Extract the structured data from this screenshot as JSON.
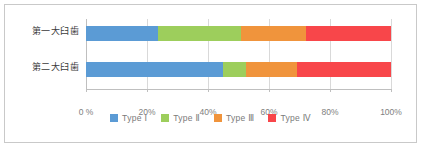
{
  "chart_data": {
    "type": "bar",
    "orientation": "horizontal",
    "stacked": true,
    "normalized_percent": true,
    "title": "",
    "xlabel": "",
    "ylabel": "",
    "categories": [
      "第一大臼歯",
      "第二大臼歯"
    ],
    "series": [
      {
        "name": "Type Ⅰ",
        "color": "#5b9bd5",
        "values": [
          23.6,
          45.0
        ]
      },
      {
        "name": "Type Ⅱ",
        "color": "#9dce5c",
        "values": [
          27.2,
          7.5
        ]
      },
      {
        "name": "Type Ⅲ",
        "color": "#f0943c",
        "values": [
          21.3,
          16.7
        ]
      },
      {
        "name": "Type Ⅳ",
        "color": "#f8464a",
        "values": [
          27.9,
          30.8
        ]
      }
    ],
    "xlim": [
      0,
      100
    ],
    "xticks": [
      0,
      20,
      40,
      60,
      80,
      100
    ],
    "xtick_labels": [
      "0 %",
      "20%",
      "40%",
      "60%",
      "80%",
      "100%"
    ],
    "grid": true,
    "legend_position": "bottom"
  },
  "colors": {
    "frame_border": "#c9c9c9",
    "gridline": "#d9d9d9",
    "axis": "#bfbfbf",
    "tick_label": "#808080",
    "category_label": "#3b3b3b",
    "legend_label": "#7a7a7a",
    "background": "#ffffff"
  }
}
